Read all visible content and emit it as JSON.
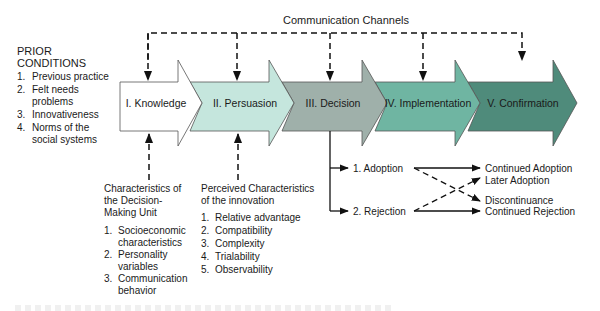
{
  "figure": {
    "top_label": "Communication Channels",
    "prior_conditions": {
      "heading_line1": "PRIOR",
      "heading_line2": "CONDITIONS",
      "items": [
        {
          "num": "1.",
          "lines": [
            "Previous practice"
          ]
        },
        {
          "num": "2.",
          "lines": [
            "Felt needs",
            "problems"
          ]
        },
        {
          "num": "3.",
          "lines": [
            "Innovativeness"
          ]
        },
        {
          "num": "4.",
          "lines": [
            "Norms of the",
            "social systems"
          ]
        }
      ]
    },
    "stages": [
      {
        "label": "I. Knowledge",
        "color": "#ffffff"
      },
      {
        "label": "II. Persuasion",
        "color": "#c5e6dd"
      },
      {
        "label": "III. Decision",
        "color": "#9fb0aa"
      },
      {
        "label": "IV. Implementation",
        "color": "#6fb5a2"
      },
      {
        "label": "V. Confirmation",
        "color": "#4f8b7b"
      }
    ],
    "decision_making_unit": {
      "heading": [
        "Characteristics of",
        "the Decision-",
        "Making Unit"
      ],
      "items": [
        {
          "num": "1.",
          "lines": [
            "Socioeconomic",
            "characteristics"
          ]
        },
        {
          "num": "2.",
          "lines": [
            "Personality",
            "variables"
          ]
        },
        {
          "num": "3.",
          "lines": [
            "Communication",
            "behavior"
          ]
        }
      ]
    },
    "innovation_characteristics": {
      "heading": [
        "Perceived Characteristics",
        "of the innovation"
      ],
      "items": [
        {
          "num": "1.",
          "label": "Relative advantage"
        },
        {
          "num": "2.",
          "label": "Compatibility"
        },
        {
          "num": "3.",
          "label": "Complexity"
        },
        {
          "num": "4.",
          "label": "Trialability"
        },
        {
          "num": "5.",
          "label": "Observability"
        }
      ]
    },
    "decision_outcomes": {
      "adoption": "1. Adoption",
      "rejection": "2. Rejection",
      "continued_adoption": "Continued Adoption",
      "later_adoption": "Later Adoption",
      "discontinuance": "Discontinuance",
      "continued_rejection": "Continued Rejection"
    }
  }
}
